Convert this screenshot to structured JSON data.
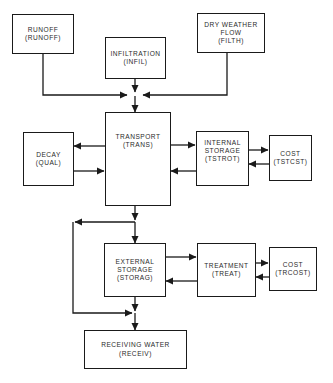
{
  "diagram": {
    "colors": {
      "line": "#1a1a1a",
      "text": "#2a2a2a",
      "background": "#ffffff"
    },
    "nodes": {
      "runoff": {
        "lines": [
          "RUNOFF",
          "(RUNOFF)"
        ]
      },
      "infiltration": {
        "lines": [
          "INFILTRATION",
          "(INFIL)"
        ]
      },
      "dry_weather_flow": {
        "lines": [
          "DRY WEATHER",
          "FLOW",
          "(FILTH)"
        ]
      },
      "decay": {
        "lines": [
          "DECAY",
          "(QUAL)"
        ]
      },
      "transport": {
        "lines": [
          "TRANSPORT",
          "(TRANS)"
        ]
      },
      "internal_storage": {
        "lines": [
          "INTERNAL",
          "STORAGE",
          "(TSTROT)"
        ]
      },
      "cost_internal": {
        "lines": [
          "COST",
          "(TSTCST)"
        ]
      },
      "external_storage": {
        "lines": [
          "EXTERNAL",
          "STORAGE",
          "(STORAG)"
        ]
      },
      "treatment": {
        "lines": [
          "TREATMENT",
          "(TREAT)"
        ]
      },
      "cost_treatment": {
        "lines": [
          "COST",
          "(TRCOST)"
        ]
      },
      "receiving_water": {
        "lines": [
          "RECEIVING WATER",
          "(RECEIV)"
        ]
      }
    },
    "edges": [
      {
        "from": "RUNOFF",
        "to": "TRANSPORT"
      },
      {
        "from": "INFILTRATION",
        "to": "TRANSPORT"
      },
      {
        "from": "DRY WEATHER FLOW",
        "to": "TRANSPORT"
      },
      {
        "from": "TRANSPORT",
        "to": "DECAY"
      },
      {
        "from": "DECAY",
        "to": "TRANSPORT"
      },
      {
        "from": "TRANSPORT",
        "to": "INTERNAL STORAGE"
      },
      {
        "from": "INTERNAL STORAGE",
        "to": "TRANSPORT"
      },
      {
        "from": "INTERNAL STORAGE",
        "to": "COST (TSTCST)"
      },
      {
        "from": "COST (TSTCST)",
        "to": "INTERNAL STORAGE"
      },
      {
        "from": "TRANSPORT",
        "to": "EXTERNAL STORAGE"
      },
      {
        "from": "TRANSPORT",
        "to": "RECEIVING WATER (bypass)"
      },
      {
        "from": "EXTERNAL STORAGE",
        "to": "TREATMENT"
      },
      {
        "from": "TREATMENT",
        "to": "EXTERNAL STORAGE"
      },
      {
        "from": "TREATMENT",
        "to": "COST (TRCOST)"
      },
      {
        "from": "COST (TRCOST)",
        "to": "TREATMENT"
      },
      {
        "from": "EXTERNAL STORAGE",
        "to": "RECEIVING WATER"
      }
    ]
  }
}
